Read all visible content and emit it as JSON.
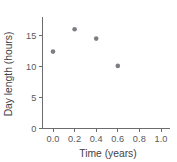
{
  "chart_data": {
    "type": "scatter",
    "title": "",
    "xlabel": "Time (years)",
    "ylabel": "Day length (hours)",
    "xlim": [
      -0.06,
      1.08
    ],
    "ylim": [
      0,
      17.5
    ],
    "xticks": [
      "0.0",
      "0.2",
      "0.4",
      "0.6",
      "0.8",
      "1.0"
    ],
    "xtick_values": [
      0.0,
      0.2,
      0.4,
      0.6,
      0.8,
      1.0
    ],
    "yticks": [
      "0",
      "5",
      "10",
      "15"
    ],
    "ytick_values": [
      0,
      5,
      10,
      15
    ],
    "grid": false,
    "legend": false,
    "marker_color": "#7d7d86",
    "axis_color": "#6b6b70",
    "points": [
      {
        "x": 0.0,
        "y": 12.4
      },
      {
        "x": 0.2,
        "y": 16.0
      },
      {
        "x": 0.4,
        "y": 14.5
      },
      {
        "x": 0.6,
        "y": 10.1
      }
    ]
  }
}
